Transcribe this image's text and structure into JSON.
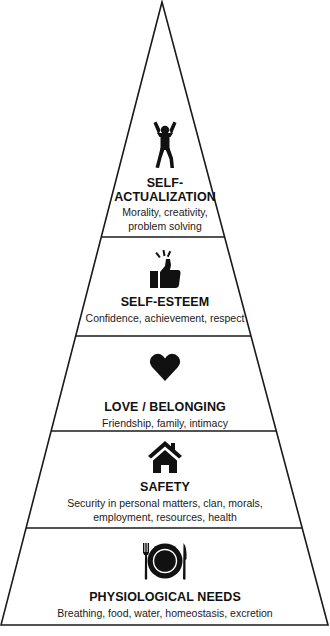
{
  "diagram": {
    "type": "pyramid",
    "colors": {
      "line": "#1a1a1a",
      "fill": "#ffffff",
      "icon": "#111111",
      "text": "#111111"
    },
    "levels": [
      {
        "id": "self-actualization",
        "icon": "person-arms-raised-icon",
        "title_line1": "SELF-",
        "title_line2": "ACTUALIZATION",
        "desc_line1": "Morality, creativity,",
        "desc_line2": "problem solving"
      },
      {
        "id": "self-esteem",
        "icon": "thumbs-up-icon",
        "title": "SELF-ESTEEM",
        "desc_line1": "Confidence, achievement, respect"
      },
      {
        "id": "love-belonging",
        "icon": "heart-icon",
        "title": "LOVE / BELONGING",
        "desc_line1": "Friendship, family, intimacy"
      },
      {
        "id": "safety",
        "icon": "house-icon",
        "title": "SAFETY",
        "desc_line1": "Security in personal matters, clan, morals,",
        "desc_line2": "employment, resources, health"
      },
      {
        "id": "physiological",
        "icon": "plate-fork-knife-icon",
        "title": "PHYSIOLOGICAL NEEDS",
        "desc_line1": "Breathing, food, water, homeostasis, excretion"
      }
    ]
  }
}
